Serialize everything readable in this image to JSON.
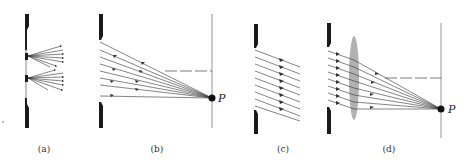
{
  "figure": {
    "panels": [
      {
        "id": "a",
        "label": "(a)",
        "description": "Two sources in slit, each emitting a fan of diverging rays"
      },
      {
        "id": "b",
        "label": "(b)",
        "description": "Rays from slit converging to point P on screen",
        "point_label": "P"
      },
      {
        "id": "c",
        "label": "(c)",
        "description": "Parallel rays leaving slit at an angle"
      },
      {
        "id": "d",
        "label": "(d)",
        "description": "Parallel rays through lens converging to point P on screen",
        "point_label": "P"
      }
    ],
    "colors": {
      "barrier": "#1a1a1a",
      "ray": "#333333",
      "lens": "#a8a8a8",
      "screen": "#555555",
      "point": "#111111"
    }
  }
}
